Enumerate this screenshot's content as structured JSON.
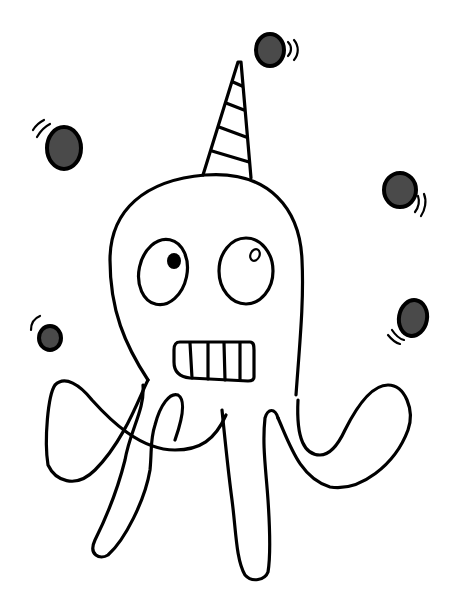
{
  "illustration": {
    "subject": "Cartoon octopus wearing a striped party hat juggling balls",
    "caption": "Juggling octopus with party hat",
    "colors": {
      "background": "#ffffff",
      "ink": "#000000",
      "ball_fill": "#4a4a4a"
    },
    "elements": {
      "party_hat": {
        "stripes": 5
      },
      "eyes": {
        "count": 2,
        "left_pupil": "filled",
        "right_pupil": "hollow-highlight"
      },
      "mouth": {
        "teeth_dividers": 4
      },
      "tentacles": 4,
      "juggling_balls": 6
    }
  }
}
